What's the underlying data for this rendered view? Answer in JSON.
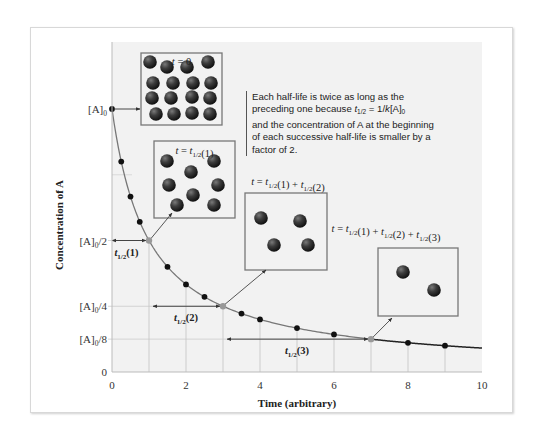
{
  "chart_data": {
    "type": "line",
    "title": "",
    "xlabel": "Time (arbitrary)",
    "ylabel": "Concentration of A",
    "xlim": [
      0,
      10
    ],
    "ylim": [
      0,
      1
    ],
    "x_ticks": [
      0,
      2,
      4,
      6,
      8,
      10
    ],
    "x_tick_labels": [
      "0",
      "2",
      "4",
      "6",
      "8",
      "10"
    ],
    "y_ticks": [
      0,
      0.125,
      0.25,
      0.5,
      1
    ],
    "y_tick_labels": [
      "0",
      "[A]0/8",
      "[A]0/4",
      "[A]0/2",
      "[A]0"
    ],
    "curve": {
      "name": "[A] = [A]0 / (1 + k[A]0 t)",
      "k_A0": 1
    },
    "series": [
      {
        "name": "data points",
        "x": [
          0,
          0.25,
          0.5,
          0.75,
          1.5,
          2,
          2.5,
          3.5,
          4,
          5,
          6,
          8,
          9
        ],
        "y": [
          1,
          0.8,
          0.667,
          0.571,
          0.4,
          0.333,
          0.286,
          0.222,
          0.2,
          0.167,
          0.143,
          0.111,
          0.1
        ]
      },
      {
        "name": "half-life points",
        "x": [
          1,
          3,
          7
        ],
        "y": [
          0.5,
          0.25,
          0.125
        ]
      }
    ],
    "half_lives": [
      {
        "label": "t1/2(1)",
        "start": 0,
        "end": 1,
        "level": 0.5
      },
      {
        "label": "t1/2(2)",
        "start": 1,
        "end": 3,
        "level": 0.25
      },
      {
        "label": "t1/2(3)",
        "start": 3,
        "end": 7,
        "level": 0.125
      }
    ],
    "insets": [
      {
        "label": "t = 0",
        "particles": 16,
        "at_time": 0
      },
      {
        "label": "t = t1/2(1)",
        "particles": 8,
        "at_time": 1
      },
      {
        "label": "t = t1/2(1) + t1/2(2)",
        "particles": 4,
        "at_time": 3
      },
      {
        "label": "t = t1/2(1) + t1/2(2) + t1/2(3)",
        "particles": 2,
        "at_time": 7
      }
    ],
    "annotation": "Each half-life is twice as long as the preceding one because t1/2 = 1/k[A]0 and the concentration of A at the beginning of each successive half-life is smaller by a factor of 2.",
    "grid": false,
    "legend": "none"
  },
  "annotation_parts": {
    "line1": "Each half-life is twice as long as the",
    "line2a": "preceding one because ",
    "line2b": " = 1/",
    "line2c": "[A]",
    "line3": "and the concentration of A at the beginning",
    "line4": "of each successive half-life is smaller by a",
    "line5": "factor of 2.",
    "t": "t",
    "half": "1/2",
    "k": "k",
    "zero": "0"
  },
  "colors": {
    "plot_bg": "#f2f2f2",
    "curve_gray": "#777777",
    "curve_black": "#222222",
    "point": "#111111",
    "half_point": "#999999",
    "particle": "#3a3a3a",
    "box_border": "#777777"
  }
}
